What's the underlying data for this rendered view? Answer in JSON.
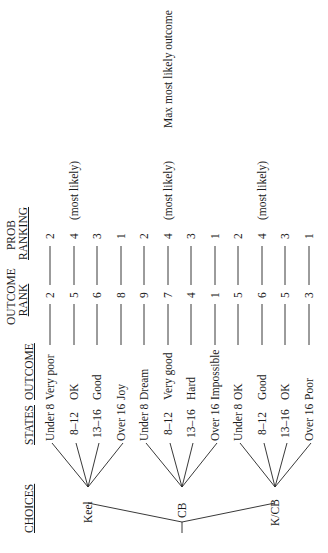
{
  "headers": {
    "choices": "CHOICES",
    "states": "STATES",
    "outcome": "OUTCOME",
    "outcome_rank_line1": "OUTCOME",
    "outcome_rank_line2": "RANK",
    "prob_ranking_line1": "PROB",
    "prob_ranking_line2": "RANKING"
  },
  "choices": [
    {
      "label": "Keel"
    },
    {
      "label": "CB"
    },
    {
      "label": "K/CB"
    }
  ],
  "rows": [
    {
      "choice": "Keel",
      "state": "Under 8",
      "outcome": "Very poor",
      "outcome_rank": "2",
      "prob_ranking": "2",
      "note": ""
    },
    {
      "choice": "Keel",
      "state": "8–12",
      "outcome": "OK",
      "outcome_rank": "5",
      "prob_ranking": "4",
      "note": "(most likely)"
    },
    {
      "choice": "Keel",
      "state": "13–16",
      "outcome": "Good",
      "outcome_rank": "6",
      "prob_ranking": "3",
      "note": ""
    },
    {
      "choice": "Keel",
      "state": "Over 16",
      "outcome": "Joy",
      "outcome_rank": "8",
      "prob_ranking": "1",
      "note": ""
    },
    {
      "choice": "CB",
      "state": "Under 8",
      "outcome": "Dream",
      "outcome_rank": "9",
      "prob_ranking": "2",
      "note": ""
    },
    {
      "choice": "CB",
      "state": "8–12",
      "outcome": "Very good",
      "outcome_rank": "7",
      "prob_ranking": "4",
      "note": "(most likely)"
    },
    {
      "choice": "CB",
      "state": "13–16",
      "outcome": "Hard",
      "outcome_rank": "4",
      "prob_ranking": "3",
      "note": ""
    },
    {
      "choice": "CB",
      "state": "Over 16",
      "outcome": "Impossible",
      "outcome_rank": "1",
      "prob_ranking": "1",
      "note": ""
    },
    {
      "choice": "K/CB",
      "state": "Under 8",
      "outcome": "OK",
      "outcome_rank": "5",
      "prob_ranking": "2",
      "note": ""
    },
    {
      "choice": "K/CB",
      "state": "8–12",
      "outcome": "Good",
      "outcome_rank": "6",
      "prob_ranking": "4",
      "note": "(most likely)"
    },
    {
      "choice": "K/CB",
      "state": "13–16",
      "outcome": "OK",
      "outcome_rank": "5",
      "prob_ranking": "3",
      "note": ""
    },
    {
      "choice": "K/CB",
      "state": "Over 16",
      "outcome": "Poor",
      "outcome_rank": "3",
      "prob_ranking": "1",
      "note": ""
    }
  ],
  "annotation": "Max most likely outcome"
}
